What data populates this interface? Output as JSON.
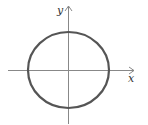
{
  "diagram": {
    "type": "circle-on-axes",
    "axes": {
      "x_label": "x",
      "y_label": "y"
    },
    "circle": {
      "center": [
        0,
        0
      ],
      "description": "circle centered at origin"
    },
    "colors": {
      "axis": "#888888",
      "curve": "#555555",
      "label": "#333333"
    }
  }
}
